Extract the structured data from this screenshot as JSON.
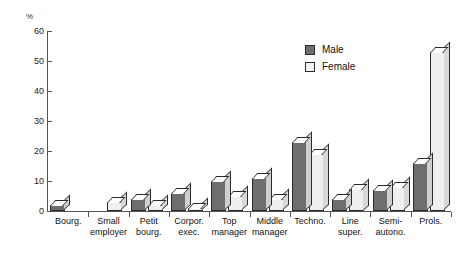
{
  "chart_data": {
    "type": "bar",
    "title": "",
    "subtitle": "",
    "xlabel": "",
    "ylabel": "%",
    "ylim": [
      0,
      60
    ],
    "yticks": [
      0,
      10,
      20,
      30,
      40,
      50,
      60
    ],
    "grid": false,
    "legend_position": "top-right",
    "categories": [
      "Bourg.",
      "Small employer",
      "Petit bourg.",
      "Corpor. exec.",
      "Top manager",
      "Middle manager",
      "Techno.",
      "Line super.",
      "Semi-autono.",
      "Prols."
    ],
    "category_lines": [
      [
        "Bourg."
      ],
      [
        "Small",
        "employer"
      ],
      [
        "Petit",
        "bourg."
      ],
      [
        "Corpor.",
        "exec."
      ],
      [
        "Top",
        "manager"
      ],
      [
        "Middle",
        "manager"
      ],
      [
        "Techno."
      ],
      [
        "Line",
        "super."
      ],
      [
        "Semi-",
        "autono."
      ],
      [
        "Prols."
      ]
    ],
    "series": [
      {
        "name": "Male",
        "color": "#6e6e6e",
        "values": [
          2,
          0,
          4,
          6,
          10,
          11,
          23,
          4,
          7,
          16
        ]
      },
      {
        "name": "Female",
        "color": "#efefef",
        "values": [
          0,
          3,
          2,
          1,
          5,
          4,
          19,
          7.5,
          8,
          53
        ]
      }
    ]
  },
  "axis": {
    "unit_label": "%",
    "tick_labels": [
      "60",
      "50",
      "40",
      "30",
      "20",
      "10",
      "0"
    ]
  },
  "legend": {
    "items": [
      {
        "label": "Male",
        "swatch": "male-swatch"
      },
      {
        "label": "Female",
        "swatch": "female-swatch"
      }
    ]
  }
}
